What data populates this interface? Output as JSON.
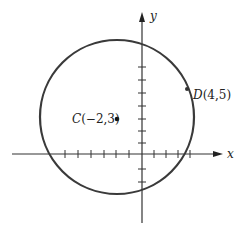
{
  "figure": {
    "axes": {
      "x_label": "x",
      "y_label": "y",
      "x_ticks": [
        -6,
        -5,
        -4,
        -3,
        -2,
        -1,
        1,
        2,
        3,
        4
      ],
      "y_ticks": [
        -2,
        -1,
        1,
        2,
        3,
        4,
        5,
        6,
        7
      ]
    },
    "circle": {
      "center": [
        -2,
        3
      ],
      "passes_through": [
        4,
        5
      ],
      "radius_squared": 40,
      "stroke_color": "#3a3a3a"
    },
    "points": [
      {
        "name": "C",
        "coords": "(−2,3)",
        "x": -2,
        "y": 3
      },
      {
        "name": "D",
        "coords": "(4,5)",
        "x": 4,
        "y": 5
      }
    ],
    "colors": {
      "axis": "#333333",
      "circle": "#3a3a3a",
      "text": "#222222"
    }
  }
}
